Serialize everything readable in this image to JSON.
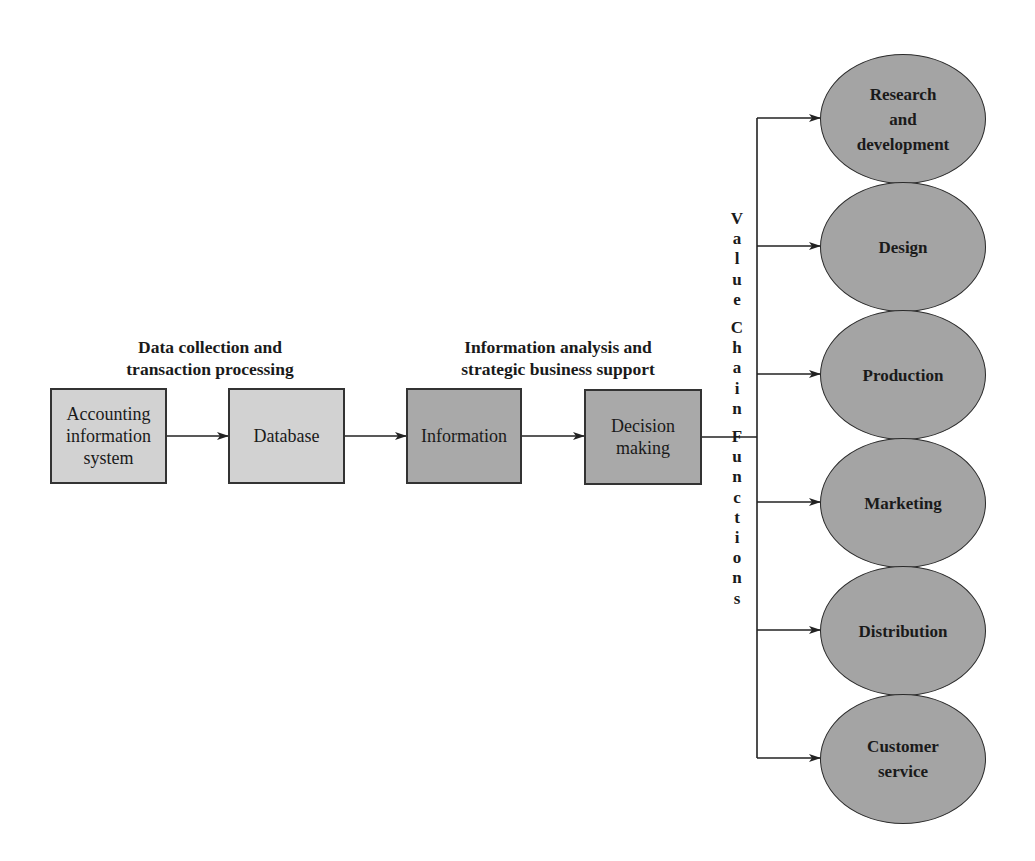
{
  "diagram": {
    "headings": {
      "left": [
        "Data collection and",
        "transaction processing"
      ],
      "right": [
        "Information analysis and",
        "strategic business support"
      ]
    },
    "flow_boxes": [
      {
        "id": "ais",
        "lines": [
          "Accounting",
          "information",
          "system"
        ]
      },
      {
        "id": "database",
        "lines": [
          "Database"
        ]
      },
      {
        "id": "information",
        "lines": [
          "Information"
        ]
      },
      {
        "id": "decision",
        "lines": [
          "Decision",
          "making"
        ]
      }
    ],
    "vertical_label": "Value Chain Functions",
    "vertical_letters": [
      "V",
      "a",
      "l",
      "u",
      "e",
      "",
      "C",
      "h",
      "a",
      "i",
      "n",
      "",
      "F",
      "u",
      "n",
      "c",
      "t",
      "i",
      "o",
      "n",
      "s"
    ],
    "value_chain_functions": [
      {
        "lines": [
          "Research",
          "and",
          "development"
        ]
      },
      {
        "lines": [
          "Design"
        ]
      },
      {
        "lines": [
          "Production"
        ]
      },
      {
        "lines": [
          "Marketing"
        ]
      },
      {
        "lines": [
          "Distribution"
        ]
      },
      {
        "lines": [
          "Customer",
          "service"
        ]
      }
    ],
    "colors": {
      "light_box": "#d2d2d2",
      "dark_box": "#a9a9a9",
      "ellipse": "#a4a4a4",
      "line": "#222222"
    }
  }
}
